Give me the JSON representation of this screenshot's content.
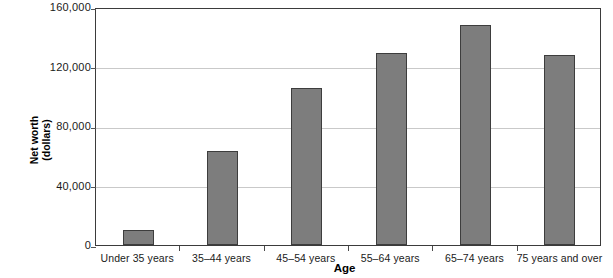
{
  "chart_data": {
    "type": "bar",
    "title": "",
    "xlabel": "Age",
    "ylabel": "Net worth (dollars)",
    "ylabel_lines": [
      "Net worth",
      "(dollars)"
    ],
    "categories": [
      "Under 35 years",
      "35–44 years",
      "45–54 years",
      "55–64 years",
      "65–74 years",
      "75 years and over"
    ],
    "values": [
      10000,
      63200,
      105800,
      128900,
      147700,
      127700
    ],
    "ylim": [
      0,
      160000
    ],
    "yticks": [
      0,
      40000,
      80000,
      120000,
      160000
    ],
    "ytick_labels": [
      "0",
      "40,000",
      "80,000",
      "120,000",
      "160,000"
    ],
    "grid": "horizontal",
    "legend": "none",
    "series": [
      {
        "name": "Net worth",
        "values": [
          10000,
          63200,
          105800,
          128900,
          147700,
          127700
        ]
      }
    ],
    "colors": {
      "bar_fill": "#7d7d7d",
      "bar_border": "#3d3d3d",
      "gridline": "#c9c9c9",
      "frame": "#3b3b3b",
      "text": "#1a1a1a"
    }
  }
}
